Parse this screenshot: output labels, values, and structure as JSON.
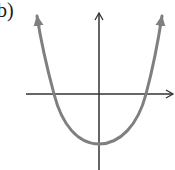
{
  "figure": {
    "label": "b)",
    "colors": {
      "axes": "#333333",
      "curve": "#7f7f7f",
      "background": "#ffffff"
    }
  },
  "axes": {
    "x_axis": {
      "arrow": "right",
      "has_ticks": false,
      "has_labels": false
    },
    "y_axis": {
      "arrow": "up",
      "has_ticks": false,
      "has_labels": false
    }
  },
  "curve": {
    "type": "parabola",
    "opens": "up",
    "vertex_position": "on y-axis, below x-axis",
    "x_intercepts": 2,
    "end_arrows": [
      "up-left",
      "up-right"
    ]
  }
}
